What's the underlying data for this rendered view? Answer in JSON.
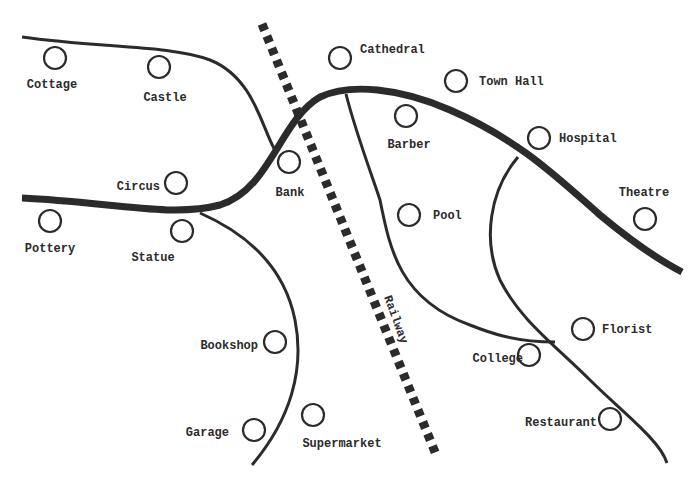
{
  "map": {
    "colors": {
      "ink": "#2b2b2b",
      "background": "#ffffff"
    },
    "railway": {
      "label": "Railway",
      "from": [
        262,
        24
      ],
      "to": [
        437,
        457
      ],
      "label_pos": [
        384,
        297
      ],
      "label_rotation": 70
    },
    "roads": [
      {
        "id": "main-road",
        "type": "major",
        "path": "M22,198 C110,202 170,218 220,205 C270,190 280,120 320,97 C350,83 400,88 450,110 C520,140 560,180 600,215 C630,240 655,258 682,272"
      },
      {
        "id": "north-road",
        "type": "minor",
        "path": "M22,37 C100,48 170,45 210,60 C255,78 262,130 276,152"
      },
      {
        "id": "south-road",
        "type": "minor",
        "path": "M200,213 C250,235 285,270 295,320 C305,370 290,420 252,465"
      },
      {
        "id": "barber-road",
        "type": "minor",
        "path": "M346,94 C355,130 370,170 380,200 C390,250 400,300 470,325 C490,333 515,342 555,342"
      },
      {
        "id": "hospital-road",
        "type": "minor",
        "path": "M518,157 C490,190 482,240 500,280 C520,320 555,345 590,380 C620,410 660,440 667,463"
      }
    ],
    "places": [
      {
        "name": "Cottage",
        "cx": 55,
        "cy": 58,
        "label_x": 52,
        "label_y": 88,
        "anchor": "middle"
      },
      {
        "name": "Castle",
        "cx": 159,
        "cy": 67,
        "label_x": 165,
        "label_y": 101,
        "anchor": "middle"
      },
      {
        "name": "Cathedral",
        "cx": 340,
        "cy": 58,
        "label_x": 360,
        "label_y": 53,
        "anchor": "start"
      },
      {
        "name": "Town Hall",
        "cx": 456,
        "cy": 81,
        "label_x": 479,
        "label_y": 85,
        "anchor": "start"
      },
      {
        "name": "Barber",
        "cx": 406,
        "cy": 116,
        "label_x": 409,
        "label_y": 148,
        "anchor": "middle"
      },
      {
        "name": "Hospital",
        "cx": 539,
        "cy": 138,
        "label_x": 559,
        "label_y": 142,
        "anchor": "start"
      },
      {
        "name": "Circus",
        "cx": 176,
        "cy": 183,
        "label_x": 160,
        "label_y": 190,
        "anchor": "end"
      },
      {
        "name": "Bank",
        "cx": 289,
        "cy": 162,
        "label_x": 290,
        "label_y": 196,
        "anchor": "middle"
      },
      {
        "name": "Theatre",
        "cx": 645,
        "cy": 219,
        "label_x": 644,
        "label_y": 196,
        "anchor": "middle"
      },
      {
        "name": "Pool",
        "cx": 409,
        "cy": 215,
        "label_x": 433,
        "label_y": 219,
        "anchor": "start"
      },
      {
        "name": "Pottery",
        "cx": 50,
        "cy": 221,
        "label_x": 50,
        "label_y": 252,
        "anchor": "middle"
      },
      {
        "name": "Statue",
        "cx": 182,
        "cy": 231,
        "label_x": 153,
        "label_y": 261,
        "anchor": "middle"
      },
      {
        "name": "Bookshop",
        "cx": 275,
        "cy": 342,
        "label_x": 258,
        "label_y": 349,
        "anchor": "end"
      },
      {
        "name": "Florist",
        "cx": 583,
        "cy": 329,
        "label_x": 602,
        "label_y": 333,
        "anchor": "start"
      },
      {
        "name": "College",
        "cx": 529,
        "cy": 355,
        "label_x": 523,
        "label_y": 362,
        "anchor": "end"
      },
      {
        "name": "Supermarket",
        "cx": 313,
        "cy": 415,
        "label_x": 342,
        "label_y": 447,
        "anchor": "middle"
      },
      {
        "name": "Garage",
        "cx": 254,
        "cy": 430,
        "label_x": 229,
        "label_y": 436,
        "anchor": "end"
      },
      {
        "name": "Restaurant",
        "cx": 610,
        "cy": 419,
        "label_x": 597,
        "label_y": 426,
        "anchor": "end"
      }
    ]
  }
}
